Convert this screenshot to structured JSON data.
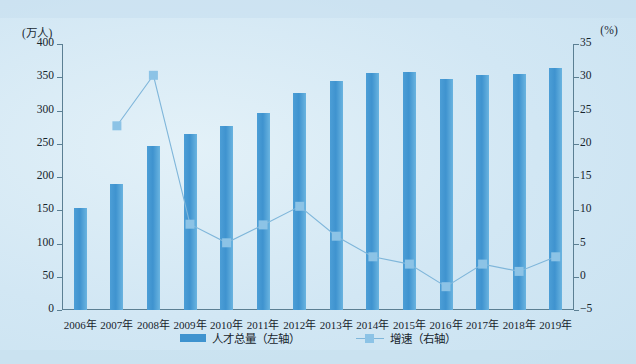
{
  "axes": {
    "left_unit": "(万人)",
    "right_unit": "(%)",
    "left_ticks": [
      "400",
      "350",
      "300",
      "250",
      "200",
      "150",
      "100",
      "50",
      "0"
    ],
    "right_ticks": [
      "35",
      "30",
      "25",
      "20",
      "15",
      "10",
      "5",
      "0",
      "-5"
    ]
  },
  "legend": {
    "bar_label": "人才总量（左轴）",
    "line_label": "增速（右轴）"
  },
  "colors": {
    "bar": "#3f93cf",
    "line": "#7fb6da",
    "marker": "#8cc3e6",
    "axis": "#5b7f93",
    "background": "#d2e7f4"
  },
  "chart_data": {
    "type": "bar",
    "title": "",
    "xlabel": "",
    "ylabel": "(万人)",
    "y2label": "(%)",
    "ylim": [
      0,
      400
    ],
    "y2lim": [
      -5,
      35
    ],
    "grid": false,
    "legend_position": "bottom",
    "categories": [
      "2006年",
      "2007年",
      "2008年",
      "2009年",
      "2010年",
      "2011年",
      "2012年",
      "2013年",
      "2014年",
      "2015年",
      "2016年",
      "2017年",
      "2018年",
      "2019年"
    ],
    "series": [
      {
        "name": "人才总量（左轴）",
        "type": "bar",
        "axis": "left",
        "unit": "万人",
        "values": [
          154,
          190,
          246,
          265,
          277,
          297,
          327,
          345,
          356,
          358,
          348,
          353,
          355,
          364
        ]
      },
      {
        "name": "增速（右轴）",
        "type": "line",
        "axis": "right",
        "unit": "%",
        "values": [
          null,
          22.7,
          30.3,
          7.9,
          5.1,
          7.8,
          10.6,
          6.1,
          3.0,
          1.9,
          -1.5,
          1.9,
          0.8,
          3.0
        ]
      }
    ]
  }
}
